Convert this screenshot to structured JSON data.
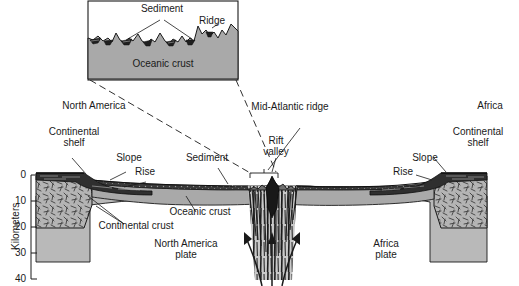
{
  "figure": {
    "type": "geologic-cross-section"
  },
  "inset": {
    "labels": {
      "sediment": "Sediment",
      "ridge": "Ridge",
      "oceanic_crust": "Oceanic crust"
    }
  },
  "main": {
    "labels": {
      "north_america": "North America",
      "continental_shelf_left": "Continental\nshelf",
      "slope_left": "Slope",
      "rise_left": "Rise",
      "sediment": "Sediment",
      "oceanic_crust": "Oceanic crust",
      "continental_crust": "Continental crust",
      "north_america_plate": "North America\nplate",
      "mid_atlantic_ridge": "Mid-Atlantic ridge",
      "rift_valley": "Rift\nvalley",
      "africa_plate": "Africa\nplate",
      "africa": "Africa",
      "continental_shelf_right": "Continental\nshelf",
      "slope_right": "Slope",
      "rise_right": "Rise"
    }
  },
  "axis": {
    "title": "Kilometers",
    "ticks": [
      "0",
      "10",
      "20",
      "30",
      "40"
    ]
  },
  "colors": {
    "background": "#ffffff",
    "ink": "#1a1a1a",
    "oceanic_crust": "#a9a9a9",
    "mantle": "#b9b9b9",
    "continental_crust": "#b0b0b0",
    "sediment_dark": "#2e2e2e",
    "magma": "#1c1c1c"
  }
}
